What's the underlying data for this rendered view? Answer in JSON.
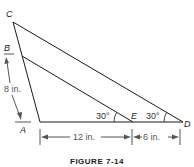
{
  "figure": {
    "caption": "FIGURE 7-14",
    "points": {
      "A": "A",
      "B": "B",
      "C": "C",
      "D": "D",
      "E": "E"
    },
    "dimensions": {
      "AB": "8 in.",
      "AE": "12 in.",
      "ED": "6 in."
    },
    "angles": {
      "at_E": "30°",
      "at_D": "30°"
    },
    "colors": {
      "line": "#1a1a1a",
      "dimension": "#666666"
    }
  }
}
